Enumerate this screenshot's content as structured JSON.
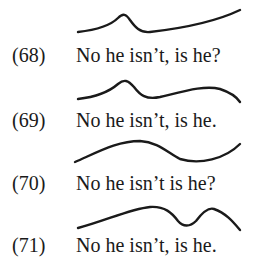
{
  "examples": [
    {
      "number": "(68)",
      "sentence": "No he isn’t, is he?",
      "contour": "M78,32 C95,30 110,26 118,18 C123,13 126,14 130,20 C135,27 140,33 150,32 C185,28 215,22 240,10"
    },
    {
      "number": "(69)",
      "sentence": "No he isn’t, is he.",
      "contour": "M78,32 C95,30 110,24 118,17 C124,12 128,13 134,20 C140,28 146,33 160,30 C185,24 205,18 220,22 C232,26 238,32 240,35"
    },
    {
      "number": "(70)",
      "sentence": "No he isn’t is he?",
      "contour": "M75,33 C100,22 118,12 140,12 C158,13 168,24 180,30 C200,36 225,30 240,15"
    },
    {
      "number": "(71)",
      "sentence": "No he isn’t, is he.",
      "contour": "M78,35 C105,28 130,16 150,14 C165,13 172,20 178,28 C183,34 190,34 196,28 C202,20 208,14 214,16 C226,20 234,30 240,37"
    }
  ]
}
